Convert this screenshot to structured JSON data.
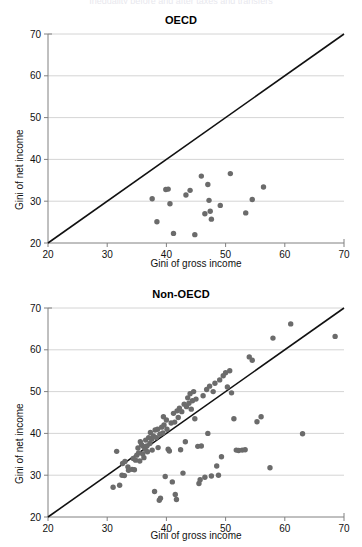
{
  "figure": {
    "cropped_header_text": "Inequality before and after taxes and transfers",
    "marker_color": "#6b6b6b",
    "line_color": "#111111",
    "grid_color": "#c9c9c9",
    "axis_color": "#808080"
  },
  "panels": [
    {
      "id": "oecd",
      "title": "OECD",
      "xlabel": "Gini of gross income",
      "ylabel": "Gini of net income"
    },
    {
      "id": "nonoecd",
      "title": "Non-OECD",
      "xlabel": "Gini of gross income",
      "ylabel": "Gini of net income"
    }
  ],
  "chart_data": [
    {
      "type": "scatter",
      "title": "OECD",
      "xlabel": "Gini of gross income",
      "ylabel": "Gini of net income",
      "xlim": [
        20,
        70
      ],
      "ylim": [
        20,
        70
      ],
      "xticks": [
        20,
        30,
        40,
        50,
        60,
        70
      ],
      "yticks": [
        20,
        30,
        40,
        50,
        60,
        70
      ],
      "grid": "horizontal",
      "legend": "none",
      "reference_line": {
        "type": "45-degree",
        "from": [
          20,
          20
        ],
        "to": [
          70,
          70
        ]
      },
      "points": [
        [
          37.6,
          30.6
        ],
        [
          38.4,
          25.1
        ],
        [
          39.9,
          32.8
        ],
        [
          40.3,
          32.9
        ],
        [
          40.6,
          29.4
        ],
        [
          41.2,
          22.3
        ],
        [
          43.3,
          31.5
        ],
        [
          44.0,
          32.6
        ],
        [
          44.8,
          22.0
        ],
        [
          45.9,
          36.0
        ],
        [
          46.5,
          27.0
        ],
        [
          47.0,
          34.0
        ],
        [
          47.2,
          30.2
        ],
        [
          47.4,
          27.6
        ],
        [
          47.6,
          25.7
        ],
        [
          49.1,
          29.0
        ],
        [
          50.8,
          36.6
        ],
        [
          53.4,
          27.2
        ],
        [
          54.5,
          30.4
        ],
        [
          56.4,
          33.4
        ]
      ]
    },
    {
      "type": "scatter",
      "title": "Non-OECD",
      "xlabel": "Gini of gross income",
      "ylabel": "Gini of net income",
      "xlim": [
        20,
        70
      ],
      "ylim": [
        20,
        70
      ],
      "xticks": [
        20,
        30,
        40,
        50,
        60,
        70
      ],
      "yticks": [
        20,
        30,
        40,
        50,
        60,
        70
      ],
      "grid": "horizontal",
      "legend": "none",
      "reference_line": {
        "type": "45-degree",
        "from": [
          20,
          20
        ],
        "to": [
          70,
          70
        ]
      },
      "points": [
        [
          31.0,
          27.1
        ],
        [
          31.6,
          35.7
        ],
        [
          32.1,
          27.6
        ],
        [
          32.5,
          30.0
        ],
        [
          32.6,
          32.8
        ],
        [
          32.9,
          29.9
        ],
        [
          33.0,
          33.3
        ],
        [
          33.5,
          32.0
        ],
        [
          33.6,
          31.2
        ],
        [
          34.2,
          31.4
        ],
        [
          34.4,
          34.0
        ],
        [
          34.6,
          31.3
        ],
        [
          34.8,
          33.6
        ],
        [
          35.0,
          34.8
        ],
        [
          35.2,
          36.5
        ],
        [
          35.3,
          35.3
        ],
        [
          35.5,
          33.4
        ],
        [
          35.6,
          38.0
        ],
        [
          35.8,
          37.3
        ],
        [
          36.0,
          35.1
        ],
        [
          36.1,
          36.9
        ],
        [
          36.2,
          34.2
        ],
        [
          36.4,
          36.2
        ],
        [
          36.5,
          38.4
        ],
        [
          36.7,
          37.0
        ],
        [
          36.8,
          35.6
        ],
        [
          37.0,
          39.0
        ],
        [
          37.2,
          37.6
        ],
        [
          37.3,
          40.2
        ],
        [
          37.5,
          38.6
        ],
        [
          37.6,
          36.0
        ],
        [
          37.8,
          39.4
        ],
        [
          38.0,
          26.1
        ],
        [
          38.1,
          40.8
        ],
        [
          38.3,
          39.0
        ],
        [
          38.5,
          41.0
        ],
        [
          38.6,
          36.6
        ],
        [
          38.8,
          24.0
        ],
        [
          38.9,
          39.8
        ],
        [
          39.0,
          24.5
        ],
        [
          39.2,
          41.5
        ],
        [
          39.4,
          40.1
        ],
        [
          39.5,
          44.0
        ],
        [
          39.6,
          42.0
        ],
        [
          39.8,
          29.7
        ],
        [
          40.0,
          43.2
        ],
        [
          40.1,
          41.0
        ],
        [
          40.3,
          36.2
        ],
        [
          40.5,
          35.8
        ],
        [
          40.8,
          42.5
        ],
        [
          41.0,
          28.4
        ],
        [
          41.2,
          44.8
        ],
        [
          41.4,
          42.7
        ],
        [
          41.5,
          25.4
        ],
        [
          41.7,
          24.2
        ],
        [
          41.8,
          45.4
        ],
        [
          42.0,
          43.8
        ],
        [
          42.2,
          46.0
        ],
        [
          42.4,
          36.1
        ],
        [
          42.6,
          45.2
        ],
        [
          42.8,
          30.5
        ],
        [
          43.0,
          47.0
        ],
        [
          43.2,
          38.0
        ],
        [
          43.4,
          46.4
        ],
        [
          43.6,
          48.5
        ],
        [
          43.8,
          47.2
        ],
        [
          44.0,
          49.5
        ],
        [
          44.2,
          45.8
        ],
        [
          44.4,
          47.8
        ],
        [
          44.6,
          50.0
        ],
        [
          44.8,
          43.5
        ],
        [
          45.0,
          48.2
        ],
        [
          45.3,
          36.9
        ],
        [
          45.5,
          28.0
        ],
        [
          45.7,
          28.9
        ],
        [
          45.9,
          37.0
        ],
        [
          46.2,
          49.0
        ],
        [
          46.5,
          29.5
        ],
        [
          46.8,
          50.5
        ],
        [
          47.0,
          40.0
        ],
        [
          47.3,
          51.3
        ],
        [
          47.6,
          29.8
        ],
        [
          47.9,
          50.0
        ],
        [
          48.2,
          52.0
        ],
        [
          48.5,
          32.2
        ],
        [
          48.8,
          30.0
        ],
        [
          49.0,
          52.8
        ],
        [
          49.3,
          34.4
        ],
        [
          49.6,
          53.8
        ],
        [
          50.0,
          54.5
        ],
        [
          50.3,
          51.1
        ],
        [
          50.7,
          55.0
        ],
        [
          51.0,
          49.7
        ],
        [
          51.4,
          43.5
        ],
        [
          51.8,
          36.0
        ],
        [
          52.2,
          35.9
        ],
        [
          52.8,
          36.0
        ],
        [
          53.3,
          36.1
        ],
        [
          54.0,
          58.3
        ],
        [
          54.5,
          57.5
        ],
        [
          55.3,
          42.8
        ],
        [
          56.0,
          44.0
        ],
        [
          57.5,
          31.8
        ],
        [
          58.0,
          62.8
        ],
        [
          61.0,
          66.2
        ],
        [
          63.0,
          39.9
        ],
        [
          68.5,
          63.2
        ]
      ]
    }
  ]
}
